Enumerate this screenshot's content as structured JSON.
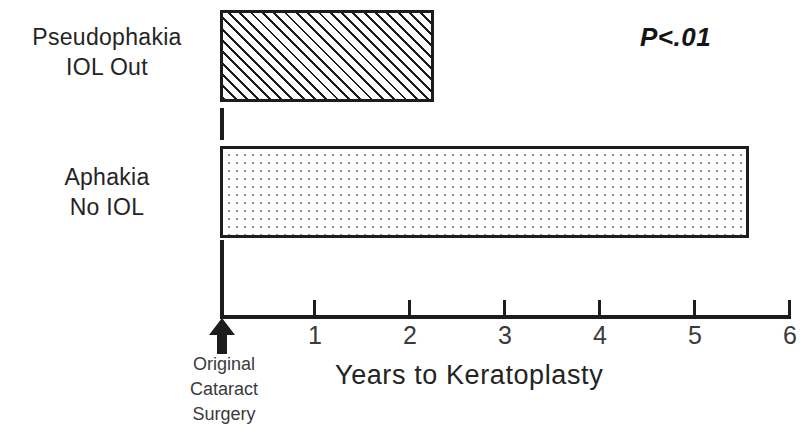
{
  "chart_data": {
    "type": "bar",
    "orientation": "horizontal",
    "title": "",
    "xlabel": "Years to Keratoplasty",
    "ylabel": "",
    "categories": [
      "Pseudophakia IOL Out",
      "Aphakia No IOL"
    ],
    "category_lines": [
      {
        "line1": "Pseudophakia",
        "line2": "IOL Out"
      },
      {
        "line1": "Aphakia",
        "line2": "No IOL"
      }
    ],
    "values": [
      2.25,
      5.57
    ],
    "series": [
      {
        "name": "Years to Keratoplasty",
        "values": [
          2.25,
          5.57
        ]
      }
    ],
    "xlim": [
      0,
      6
    ],
    "xticks": [
      0,
      1,
      2,
      3,
      4,
      5,
      6
    ],
    "xtick_labels": [
      "",
      "1",
      "2",
      "3",
      "4",
      "5",
      "6"
    ],
    "grid": false,
    "legend": false,
    "annotations": [
      {
        "text": "P<.01",
        "kind": "significance"
      },
      {
        "text": "Original Cataract Surgery",
        "kind": "origin-marker"
      }
    ],
    "bar_fills": [
      "diagonal-hatch",
      "dot-stipple"
    ],
    "colors": {
      "bar_outline": "#1c1c1c",
      "hatch": "#1c1c1c",
      "dots": "#8c8c8c",
      "axis": "#1c1c1c",
      "text": "#242424",
      "background": "#ffffff"
    }
  },
  "annotation": {
    "p_value": "P<.01"
  },
  "axis": {
    "title": "Years to Keratoplasty",
    "ticks": [
      {
        "label": "",
        "value": 0
      },
      {
        "label": "1",
        "value": 1
      },
      {
        "label": "2",
        "value": 2
      },
      {
        "label": "3",
        "value": 3
      },
      {
        "label": "4",
        "value": 4
      },
      {
        "label": "5",
        "value": 5
      },
      {
        "label": "6",
        "value": 6
      }
    ]
  },
  "origin_marker": {
    "line1": "Original",
    "line2": "Cataract",
    "line3": "Surgery"
  }
}
